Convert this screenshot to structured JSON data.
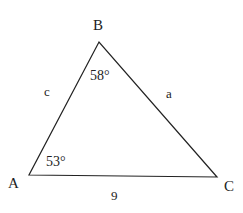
{
  "diagram": {
    "type": "triangle",
    "stroke_color": "#222222",
    "vertices": [
      {
        "id": "A",
        "label": "A",
        "x": 29,
        "y": 175
      },
      {
        "id": "B",
        "label": "B",
        "x": 99,
        "y": 42
      },
      {
        "id": "C",
        "label": "C",
        "x": 217,
        "y": 177
      }
    ],
    "sides": [
      {
        "id": "c",
        "label": "c",
        "between": [
          "A",
          "B"
        ]
      },
      {
        "id": "a",
        "label": "a",
        "between": [
          "B",
          "C"
        ]
      },
      {
        "id": "b",
        "label": "9",
        "between": [
          "A",
          "C"
        ]
      }
    ],
    "angles": [
      {
        "at": "B",
        "label": "58°"
      },
      {
        "at": "A",
        "label": "53°"
      }
    ]
  },
  "labels": {
    "vertex_a": "A",
    "vertex_b": "B",
    "vertex_c": "C",
    "side_a": "a",
    "side_c": "c",
    "side_b": "9",
    "angle_b": "58°",
    "angle_a": "53°"
  }
}
